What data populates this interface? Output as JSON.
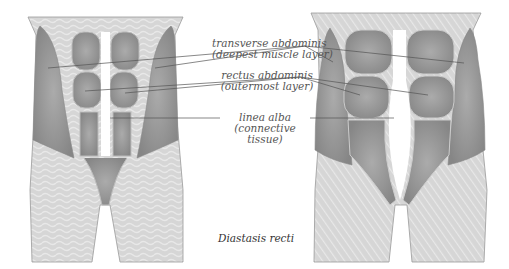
{
  "labels": {
    "transverse": {
      "line1": "transverse abdominis",
      "line2": "(deepest muscle layer)"
    },
    "rectus": {
      "line1": "rectus abdominis",
      "line2": "(outermost layer)"
    },
    "linea": {
      "line1": "linea alba",
      "line2": "(connective",
      "line3": "tissue)"
    }
  },
  "caption": "Diastasis recti",
  "figures": [
    {
      "name": "normal-abdomen",
      "description": "Normal abdominal muscles with narrow linea alba"
    },
    {
      "name": "diastasis-abdomen",
      "description": "Separated rectus abdominis with widened linea alba"
    }
  ],
  "colors": {
    "skin": "#d4d4d4",
    "skin_stripe": "#e6e6e6",
    "muscle": "#9a9a9a",
    "muscle_dark": "#7e7e7e",
    "outline": "#777777",
    "leader": "#555555"
  }
}
